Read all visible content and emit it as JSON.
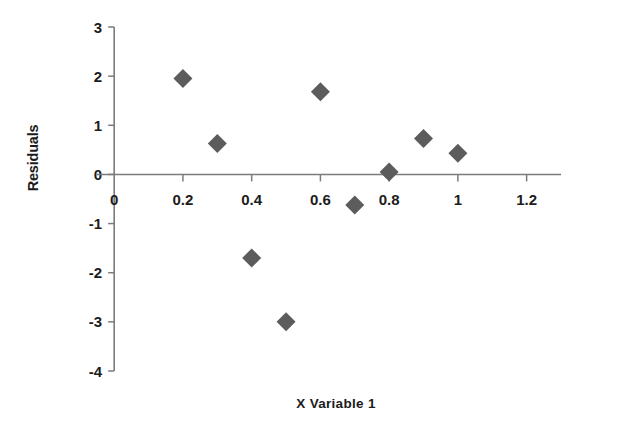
{
  "chart_data": {
    "type": "scatter",
    "title": "",
    "xlabel": "X Variable 1",
    "ylabel": "Residuals",
    "xlim": [
      -0.05,
      1.3
    ],
    "ylim": [
      -4,
      3
    ],
    "x_ticks": [
      0,
      0.2,
      0.4,
      0.6,
      0.8,
      1,
      1.2
    ],
    "x_tick_labels": [
      "0",
      "0.2",
      "0.4",
      "0.6",
      "0.8",
      "1",
      "1.2"
    ],
    "y_ticks": [
      -4,
      -3,
      -2,
      -1,
      0,
      1,
      2,
      3
    ],
    "y_tick_labels": [
      "-4",
      "-3",
      "-2",
      "-1",
      "0",
      "1",
      "2",
      "3"
    ],
    "grid": false,
    "legend": false,
    "marker": "diamond",
    "marker_color": "#5c5c5c",
    "axis_color": "#7b7b7b",
    "series": [
      {
        "name": "Residuals",
        "x": [
          0.2,
          0.3,
          0.4,
          0.5,
          0.6,
          0.7,
          0.8,
          0.9,
          1.0
        ],
        "y": [
          1.95,
          0.63,
          -1.7,
          -3.0,
          1.68,
          -0.62,
          0.05,
          0.73,
          0.43
        ]
      }
    ]
  }
}
